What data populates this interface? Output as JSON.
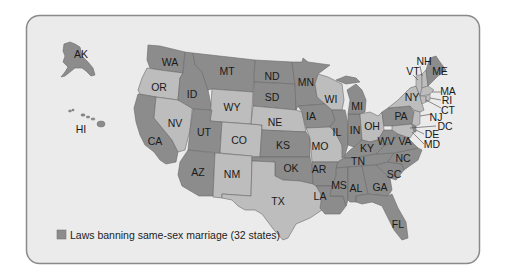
{
  "map": {
    "title": "Laws banning same-sex marriage",
    "legend": {
      "label": "Laws banning same-sex marriage (32 states)",
      "color": "#8c8c8c"
    },
    "colors": {
      "ban": "#8c8c8c",
      "no_ban": "#bdbdbd",
      "background": "#ebebeb",
      "border": "#8a8a8a"
    },
    "states_with_ban": [
      "AK",
      "WA",
      "MT",
      "ND",
      "MN",
      "SD",
      "ID",
      "UT",
      "CA",
      "AZ",
      "KS",
      "OK",
      "IA",
      "IL",
      "IN",
      "MI",
      "KY",
      "TN",
      "MS",
      "AL",
      "GA",
      "SC",
      "NC",
      "VA",
      "WV",
      "PA",
      "LA",
      "FL",
      "AR",
      "ME",
      "DE",
      "HI"
    ],
    "states_without_ban": [
      "OR",
      "NV",
      "WY",
      "CO",
      "NM",
      "TX",
      "NE",
      "MO",
      "WI",
      "OH",
      "NY",
      "VT",
      "NH",
      "MA",
      "RI",
      "CT",
      "NJ",
      "MD",
      "DC"
    ],
    "labels": {
      "AK": "AK",
      "HI": "HI",
      "WA": "WA",
      "OR": "OR",
      "CA": "CA",
      "NV": "NV",
      "ID": "ID",
      "MT": "MT",
      "WY": "WY",
      "UT": "UT",
      "CO": "CO",
      "AZ": "AZ",
      "NM": "NM",
      "ND": "ND",
      "SD": "SD",
      "NE": "NE",
      "KS": "KS",
      "OK": "OK",
      "TX": "TX",
      "MN": "MN",
      "IA": "IA",
      "MO": "MO",
      "AR": "AR",
      "LA": "LA",
      "WI": "WI",
      "IL": "IL",
      "MI": "MI",
      "IN": "IN",
      "OH": "OH",
      "KY": "KY",
      "TN": "TN",
      "MS": "MS",
      "AL": "AL",
      "GA": "GA",
      "FL": "FL",
      "SC": "SC",
      "NC": "NC",
      "VA": "VA",
      "WV": "WV",
      "PA": "PA",
      "NY": "NY",
      "VT": "VT",
      "NH": "NH",
      "ME": "ME",
      "MA": "MA",
      "RI": "RI",
      "CT": "CT",
      "NJ": "NJ",
      "DC": "DC",
      "DE": "DE",
      "MD": "MD"
    }
  }
}
